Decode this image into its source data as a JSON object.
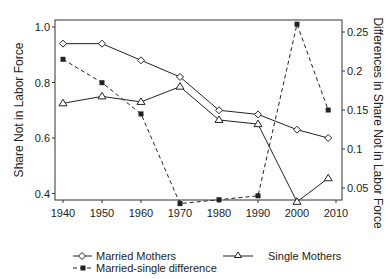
{
  "chart_data": {
    "type": "line",
    "title": "",
    "xlabel": "",
    "ylabel": "Share Not in Labor Force",
    "ylabel_right": "Differences in Share Not in Labor Force",
    "x": [
      1940,
      1950,
      1960,
      1970,
      1980,
      1990,
      2000,
      2008
    ],
    "xlim": [
      1938,
      2012
    ],
    "ylim": [
      0.35,
      1.02
    ],
    "ylim_right": [
      0.02,
      0.265
    ],
    "xticks": [
      1940,
      1950,
      1960,
      1970,
      1980,
      1990,
      2000,
      2010
    ],
    "yticks_left": [
      0.4,
      0.6,
      0.8,
      1.0
    ],
    "yticks_left_labels": [
      "0.4",
      "0.6",
      "0.8",
      "1.0"
    ],
    "yticks_right": [
      0.05,
      0.1,
      0.15,
      0.2,
      0.25
    ],
    "yticks_right_labels": [
      "0.05",
      "0.1",
      "0.15",
      "0.2",
      "0.25"
    ],
    "grid": false,
    "legend_position": "bottom",
    "series": [
      {
        "name": "Married Mothers",
        "axis": "left",
        "marker": "diamond-open",
        "line": "solid",
        "values": [
          0.94,
          0.94,
          0.88,
          0.82,
          0.7,
          0.685,
          0.63,
          0.6
        ]
      },
      {
        "name": "Single Mothers",
        "axis": "left",
        "marker": "triangle-open",
        "line": "solid",
        "values": [
          0.725,
          0.75,
          0.73,
          0.785,
          0.665,
          0.65,
          0.37,
          0.455
        ]
      },
      {
        "name": "Married-single difference",
        "axis": "right",
        "marker": "square-filled",
        "line": "dashed",
        "values": [
          0.215,
          0.185,
          0.145,
          0.03,
          0.035,
          0.04,
          0.26,
          0.15
        ]
      }
    ]
  },
  "legend": {
    "married": "Married Mothers",
    "single": "Single Mothers",
    "difference": "Married-single difference"
  },
  "axes": {
    "left_label": "Share Not in Labor Force",
    "right_label": "Differences in Share Not in Labor Force"
  }
}
